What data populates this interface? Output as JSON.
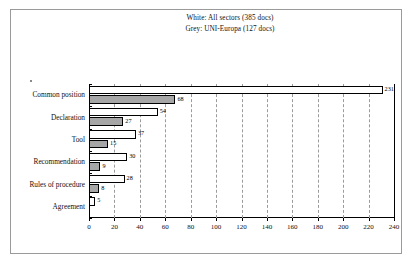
{
  "legend": {
    "lines": [
      "White:  All sectors (385 docs)",
      "Grey:  UNI-Europa (127 docs)"
    ]
  },
  "axis": {
    "ticks": [
      "0",
      "20",
      "40",
      "60",
      "80",
      "100",
      "120",
      "140",
      "160",
      "180",
      "200",
      "220",
      "240"
    ]
  },
  "chart_data": {
    "type": "bar",
    "orientation": "horizontal",
    "title": "",
    "subtitle": "",
    "xlabel": "",
    "ylabel": "",
    "xlim": [
      0,
      240
    ],
    "xtick_step": 20,
    "grid": true,
    "legend_position": "top-center",
    "categories": [
      "Common position",
      "Declaration",
      "Tool",
      "Recommendation",
      "Rules of procedure",
      "Agreement"
    ],
    "series": [
      {
        "name": "White:  All sectors (385 docs)",
        "short_name": "All sectors",
        "color": "#ffffff",
        "edge_color": "#000000",
        "total_docs": 385,
        "values": [
          231,
          54,
          37,
          30,
          28,
          5
        ],
        "labels": [
          "231",
          "54",
          "37",
          "30",
          "28",
          "5"
        ]
      },
      {
        "name": "Grey:  UNI-Europa (127 docs)",
        "short_name": "UNI-Europa",
        "color": "#a6a6a6",
        "edge_color": "#000000",
        "total_docs": 127,
        "values": [
          68,
          27,
          15,
          9,
          8,
          null
        ],
        "labels": [
          "68",
          "27",
          "15",
          "9",
          "8",
          ""
        ]
      }
    ]
  }
}
